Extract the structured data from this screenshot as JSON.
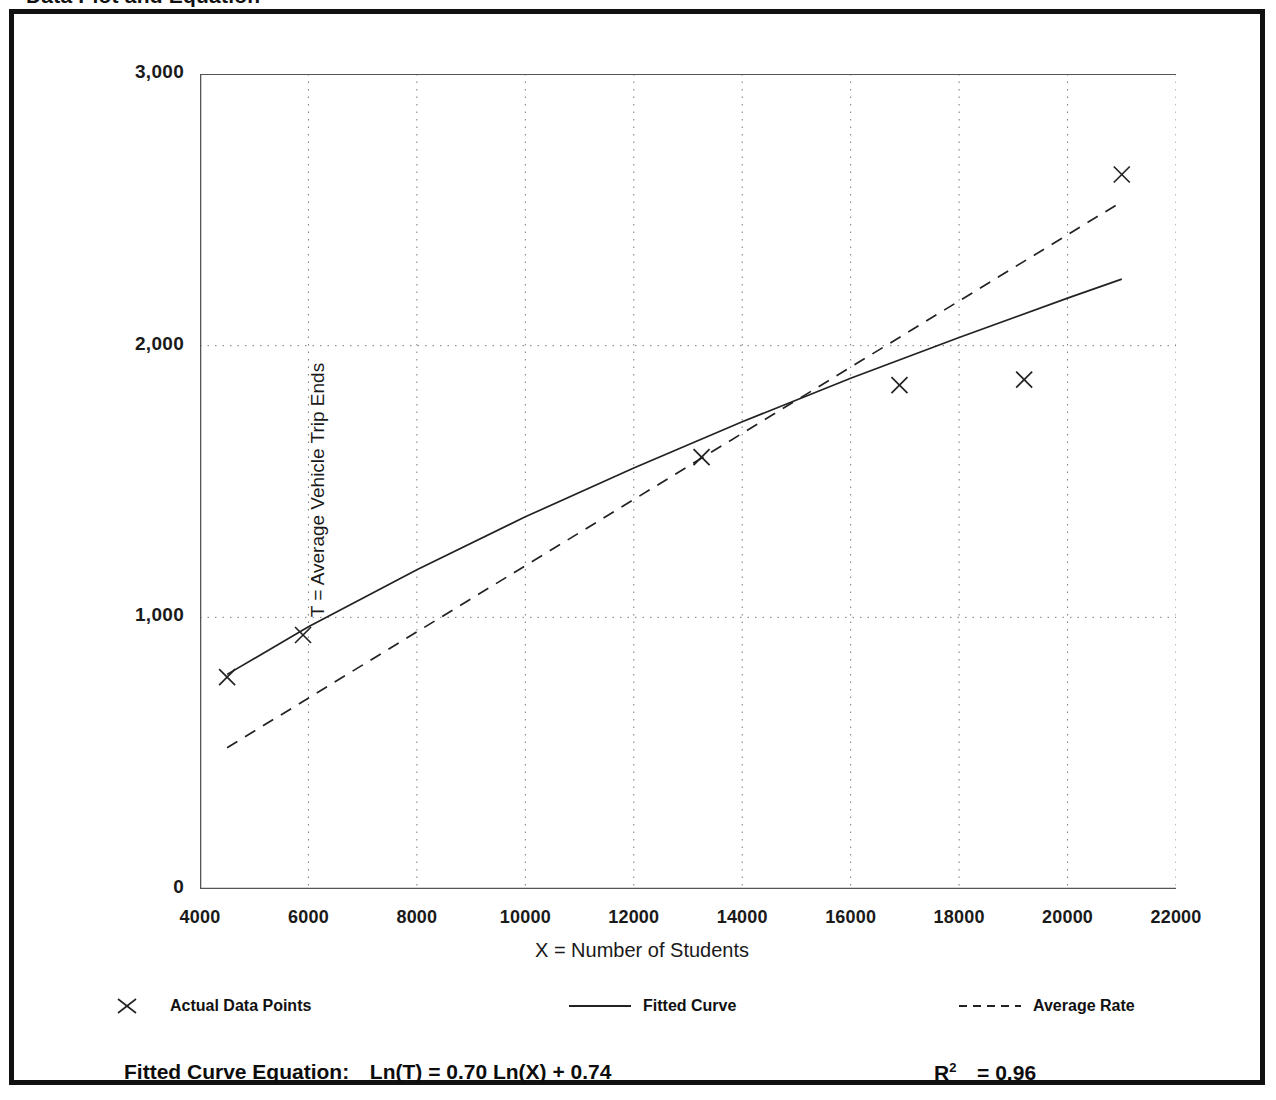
{
  "page": {
    "heading": "Data Plot and Equation"
  },
  "chart_data": {
    "type": "scatter",
    "title": "Data Plot and Equation",
    "xlabel": "X = Number of Students",
    "ylabel": "T = Average Vehicle Trip Ends",
    "xlim": [
      4000,
      22000
    ],
    "ylim": [
      0,
      3000
    ],
    "xticks": [
      "4000",
      "6000",
      "8000",
      "10000",
      "12000",
      "14000",
      "16000",
      "18000",
      "20000",
      "22000"
    ],
    "xtick_values": [
      4000,
      6000,
      8000,
      10000,
      12000,
      14000,
      16000,
      18000,
      20000,
      22000
    ],
    "yticks": [
      "0",
      "1,000",
      "2,000",
      "3,000"
    ],
    "ytick_values": [
      0,
      1000,
      2000,
      3000
    ],
    "y_minor_ticks": [
      500,
      1500,
      2500
    ],
    "grid": "dotted vertical at every x tick; dotted horizontal at 1,000 and 2,000",
    "legend_position": "below plot, horizontal",
    "series": [
      {
        "name": "Actual Data Points",
        "type": "scatter",
        "marker": "x",
        "color": "#222222",
        "points": [
          {
            "x": 4500,
            "y": 780
          },
          {
            "x": 5900,
            "y": 935
          },
          {
            "x": 13250,
            "y": 1590
          },
          {
            "x": 16900,
            "y": 1855
          },
          {
            "x": 19200,
            "y": 1875
          },
          {
            "x": 21000,
            "y": 2630
          }
        ]
      },
      {
        "name": "Fitted Curve",
        "type": "line",
        "style": "solid",
        "color": "#222222",
        "equation": "T = exp(0.74) * X^0.70",
        "points": [
          {
            "x": 4500,
            "y": 790
          },
          {
            "x": 6000,
            "y": 965
          },
          {
            "x": 8000,
            "y": 1175
          },
          {
            "x": 10000,
            "y": 1370
          },
          {
            "x": 12000,
            "y": 1550
          },
          {
            "x": 14000,
            "y": 1720
          },
          {
            "x": 16000,
            "y": 1880
          },
          {
            "x": 18000,
            "y": 2030
          },
          {
            "x": 20000,
            "y": 2175
          },
          {
            "x": 21000,
            "y": 2245
          }
        ]
      },
      {
        "name": "Average Rate",
        "type": "line",
        "style": "dashed",
        "color": "#222222",
        "points": [
          {
            "x": 4500,
            "y": 520
          },
          {
            "x": 21000,
            "y": 2530
          }
        ]
      }
    ],
    "annotations": {
      "fitted_curve_equation": "Ln(T) = 0.70 Ln(X) + 0.74",
      "r_squared": "0.96"
    }
  },
  "legend": {
    "items": [
      {
        "label": "Actual Data Points",
        "key": "x-marker-icon"
      },
      {
        "label": "Fitted Curve",
        "key": "solid-line-icon"
      },
      {
        "label": "Average Rate",
        "key": "dashed-line-icon"
      }
    ]
  },
  "footer": {
    "equation_label": "Fitted Curve Equation:",
    "equation_value": "Ln(T) = 0.70 Ln(X) + 0.74",
    "r_label": "R",
    "r_exponent": "2",
    "r_value": "= 0.96"
  }
}
